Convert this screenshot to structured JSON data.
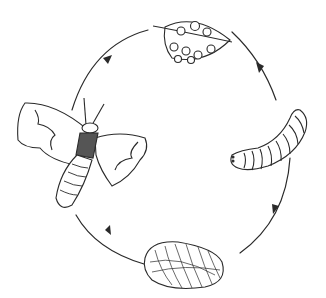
{
  "diagram": {
    "type": "life-cycle",
    "direction": "clockwise",
    "stroke_color": "#2a2a2a",
    "background": "#ffffff",
    "stages": [
      {
        "id": "egg",
        "position": "top",
        "depiction": "leaf with eggs",
        "egg_count": 9
      },
      {
        "id": "larva",
        "position": "right",
        "depiction": "caterpillar"
      },
      {
        "id": "pupa",
        "position": "bottom",
        "depiction": "cocoon"
      },
      {
        "id": "adult",
        "position": "left",
        "depiction": "moth"
      }
    ],
    "arrows": [
      {
        "from": "egg",
        "to": "larva"
      },
      {
        "from": "larva",
        "to": "pupa"
      },
      {
        "from": "pupa",
        "to": "adult"
      },
      {
        "from": "adult",
        "to": "egg"
      }
    ]
  }
}
